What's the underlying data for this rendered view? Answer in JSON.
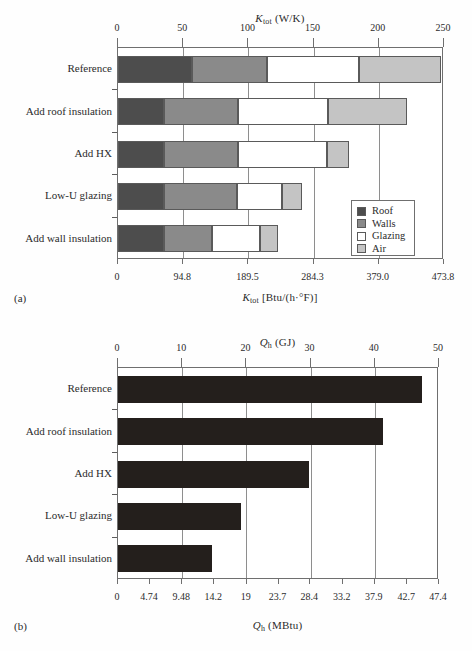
{
  "figure": {
    "panel_a_tag": "(a)",
    "panel_b_tag": "(b)"
  },
  "chart_data": [
    {
      "id": "panel-a",
      "type": "bar",
      "orientation": "horizontal",
      "stacked": true,
      "title": "",
      "top_axis_label": "K_tot (W/K)",
      "top_axis_label_parts": {
        "symbol": "K",
        "subscript": "tot",
        "units": "(W/K)"
      },
      "bottom_axis_label": "K_tot [Btu/(h·°F)]",
      "bottom_axis_label_parts": {
        "symbol": "K",
        "subscript": "tot",
        "units": "[Btu/(h·°F)]"
      },
      "categories": [
        "Reference",
        "Add roof insulation",
        "Add HX",
        "Low-U glazing",
        "Add wall insulation"
      ],
      "xlim": [
        0,
        250
      ],
      "xticks": [
        0,
        50,
        100,
        150,
        200,
        250
      ],
      "xtick_labels": [
        "0",
        "50",
        "100",
        "150",
        "200",
        "250"
      ],
      "xlim_secondary": [
        0,
        473.8
      ],
      "xticks_secondary": [
        0,
        94.8,
        189.5,
        284.3,
        379.0,
        473.8
      ],
      "xtick_labels_secondary": [
        "0",
        "94.8",
        "189.5",
        "284.3",
        "379.0",
        "473.8"
      ],
      "grid": true,
      "legend_position": "lower-right",
      "series": [
        {
          "name": "Roof",
          "color": "#4d4d4d",
          "values": [
            57,
            35,
            35,
            35,
            35
          ]
        },
        {
          "name": "Walls",
          "color": "#8a8a8a",
          "values": [
            57,
            57,
            57,
            56,
            37
          ]
        },
        {
          "name": "Glazing",
          "color": "#ffffff",
          "values": [
            71,
            69,
            68,
            35,
            37
          ]
        },
        {
          "name": "Air",
          "color": "#c4c4c4",
          "values": [
            63,
            61,
            17,
            15,
            14
          ]
        }
      ],
      "totals": [
        248,
        222,
        177,
        141,
        123
      ]
    },
    {
      "id": "panel-b",
      "type": "bar",
      "orientation": "horizontal",
      "stacked": false,
      "title": "",
      "top_axis_label": "Q_h (GJ)",
      "top_axis_label_parts": {
        "symbol": "Q",
        "subscript": "h",
        "units": "(GJ)"
      },
      "bottom_axis_label": "Q_h (MBtu)",
      "bottom_axis_label_parts": {
        "symbol": "Q",
        "subscript": "h",
        "units": "(MBtu)"
      },
      "categories": [
        "Reference",
        "Add roof insulation",
        "Add HX",
        "Low-U glazing",
        "Add wall insulation"
      ],
      "xlim": [
        0,
        50
      ],
      "xticks": [
        0,
        10,
        20,
        30,
        40,
        50
      ],
      "xtick_labels": [
        "0",
        "10",
        "20",
        "30",
        "40",
        "50"
      ],
      "xlim_secondary": [
        0,
        47.4
      ],
      "xticks_secondary": [
        0,
        4.74,
        9.48,
        14.2,
        19,
        23.7,
        28.4,
        33.2,
        37.9,
        42.7,
        47.4
      ],
      "xtick_labels_secondary": [
        "0",
        "4.74",
        "9.48",
        "14.2",
        "19",
        "23.7",
        "28.4",
        "33.2",
        "37.9",
        "42.7",
        "47.4"
      ],
      "grid": true,
      "bar_color": "#241f1c",
      "values": [
        47.4,
        41.2,
        29.8,
        19.2,
        14.6
      ]
    }
  ]
}
